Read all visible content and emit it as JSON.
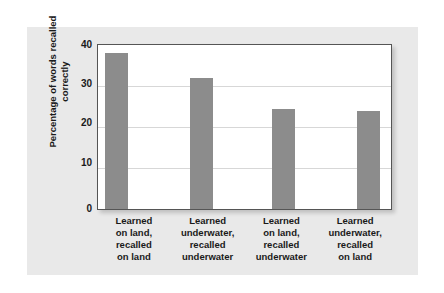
{
  "chart_data": {
    "type": "bar",
    "title": "",
    "subtitle": "",
    "xlabel": "",
    "ylabel": "Percentage of words recalled correctly",
    "ylabel_lines": [
      "Percentage of words",
      "recalled correctly"
    ],
    "ylim": [
      0,
      40
    ],
    "yticks": [
      40,
      30,
      20,
      10,
      0
    ],
    "ytick_labels": [
      "40",
      "30",
      "20",
      "10",
      "0"
    ],
    "grid": true,
    "grid_axis": "y",
    "legend": false,
    "legend_position": "none",
    "bar_color": "#8c8c8c",
    "plot_background": "#ffffff",
    "panel_background": "#e9e9e9",
    "categories": [
      "Learned on land, recalled on land",
      "Learned underwater, recalled underwater",
      "Learned on land, recalled underwater",
      "Learned underwater, recalled on land"
    ],
    "category_lines": [
      [
        "Learned",
        "on land,",
        "recalled",
        "on land"
      ],
      [
        "Learned",
        "underwater,",
        "recalled",
        "underwater"
      ],
      [
        "Learned",
        "on land,",
        "recalled",
        "underwater"
      ],
      [
        "Learned",
        "underwater,",
        "recalled",
        "on land"
      ]
    ],
    "values": [
      38,
      32,
      24.5,
      24
    ]
  }
}
